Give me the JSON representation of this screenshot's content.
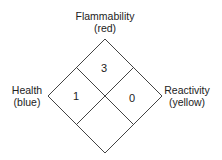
{
  "diagram": {
    "type": "NFPA 704 hazard diamond",
    "labels": {
      "top": {
        "name": "Flammability",
        "color_note": "(red)"
      },
      "left": {
        "name": "Health",
        "color_note": "(blue)"
      },
      "right": {
        "name": "Reactivity",
        "color_note": "(yellow)"
      }
    },
    "values": {
      "flammability": "3",
      "health": "1",
      "reactivity": "0",
      "special": ""
    },
    "colors": {
      "line": "#444444",
      "background": "#ffffff"
    }
  }
}
